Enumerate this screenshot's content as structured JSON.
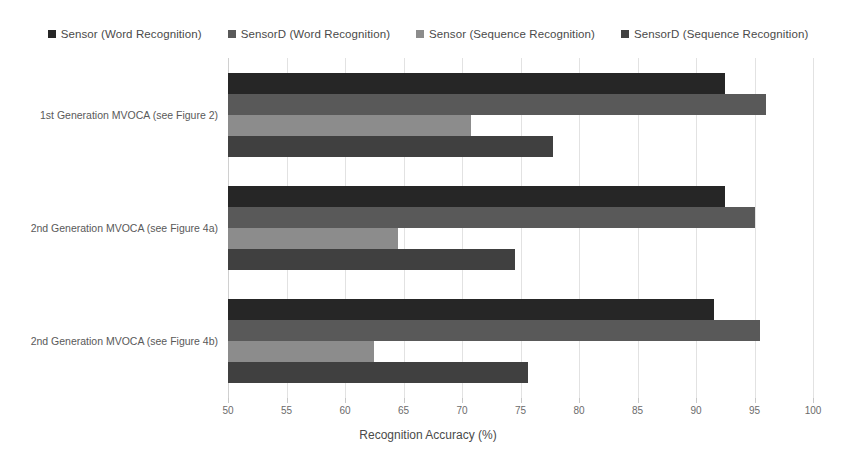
{
  "chart_data": {
    "type": "bar",
    "orientation": "horizontal",
    "title": "",
    "xlabel": "Recognition Accuracy (%)",
    "ylabel": "",
    "xlim": [
      50,
      100
    ],
    "xticks": [
      50,
      55,
      60,
      65,
      70,
      75,
      80,
      85,
      90,
      95,
      100
    ],
    "xtick_labels": [
      "50",
      "55",
      "60",
      "65",
      "70",
      "75",
      "80",
      "85",
      "90",
      "95",
      "100"
    ],
    "grid": true,
    "legend_position": "top",
    "categories": [
      "1st Generation MVOCA (see Figure 2)",
      "2nd Generation MVOCA (see Figure 4a)",
      "2nd Generation MVOCA (see Figure 4b)"
    ],
    "series": [
      {
        "name": "Sensor (Word Recognition)",
        "color": "#262626",
        "values": [
          92.5,
          92.5,
          91.5
        ]
      },
      {
        "name": "SensorD (Word Recognition)",
        "color": "#595959",
        "values": [
          96.0,
          95.0,
          95.5
        ]
      },
      {
        "name": "Sensor (Sequence Recognition)",
        "color": "#8c8c8c",
        "values": [
          70.8,
          64.5,
          62.5
        ]
      },
      {
        "name": "SensorD (Sequence Recognition)",
        "color": "#404040",
        "values": [
          77.8,
          74.5,
          75.6
        ]
      }
    ]
  },
  "legend": {
    "items": [
      {
        "label": "Sensor (Word Recognition)",
        "color": "#262626"
      },
      {
        "label": "SensorD (Word Recognition)",
        "color": "#595959"
      },
      {
        "label": "Sensor (Sequence Recognition)",
        "color": "#8c8c8c"
      },
      {
        "label": "SensorD (Sequence Recognition)",
        "color": "#404040"
      }
    ]
  }
}
